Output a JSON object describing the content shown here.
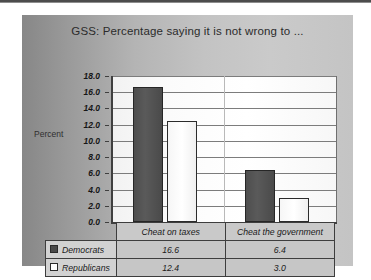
{
  "chart_data": {
    "type": "bar",
    "title": "GSS: Percentage saying it is not wrong to ...",
    "xlabel": "",
    "ylabel": "Percent",
    "categories": [
      "Cheat on taxes",
      "Cheat the government"
    ],
    "series": [
      {
        "name": "Democrats",
        "values": [
          16.6,
          6.4
        ],
        "color": "#4a4a4a",
        "swatch": "filled-square"
      },
      {
        "name": "Republicans",
        "values": [
          12.4,
          3.0
        ],
        "color": "#ffffff",
        "swatch": "hollow-square"
      }
    ],
    "ylim": [
      0.0,
      18.0
    ],
    "ytick_step": 2.0,
    "yticks": [
      "18.0",
      "16.0",
      "14.0",
      "12.0",
      "10.0",
      "8.0",
      "6.0",
      "4.0",
      "2.0",
      "0.0"
    ],
    "grid": "horizontal",
    "legend_position": "bottom-table",
    "data_table_shown": true
  },
  "panel": {
    "background_color": "#b4b4b4",
    "plot_background_color": "#fbfbfb",
    "axis_color": "#3f3f3f",
    "gridline_color": "#7c7c7c"
  },
  "table": {
    "corner_label": "",
    "column_headers": [
      "Cheat on taxes",
      "Cheat the government"
    ],
    "rows": [
      {
        "label": "Democrats",
        "values": [
          "16.6",
          "6.4"
        ]
      },
      {
        "label": "Republicans",
        "values": [
          "12.4",
          "3.0"
        ]
      }
    ]
  }
}
